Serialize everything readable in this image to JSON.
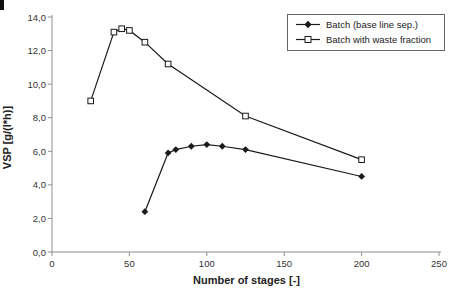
{
  "chart_data": {
    "type": "line",
    "title": "",
    "xlabel": "Number of stages [-]",
    "ylabel": "VSP [g/(l*h)]",
    "xlim": [
      0,
      250
    ],
    "ylim": [
      0,
      14
    ],
    "grid": false,
    "legend_position": "top-right",
    "x_ticks": [
      0,
      50,
      100,
      150,
      200,
      250
    ],
    "x_tick_labels": [
      "0",
      "50",
      "100",
      "150",
      "200",
      "250"
    ],
    "y_ticks": [
      0,
      2,
      4,
      6,
      8,
      10,
      12,
      14
    ],
    "y_tick_labels": [
      "0,0",
      "2,0",
      "4,0",
      "6,0",
      "8,0",
      "10,0",
      "12,0",
      "14,0"
    ],
    "series": [
      {
        "name": "Batch (base line sep.)",
        "marker": "filled-diamond",
        "color": "#1a1a1a",
        "x": [
          60,
          75,
          80,
          90,
          100,
          110,
          125,
          200
        ],
        "y": [
          2.4,
          5.9,
          6.1,
          6.3,
          6.4,
          6.3,
          6.1,
          4.5
        ]
      },
      {
        "name": "Batch with waste fraction",
        "marker": "open-square",
        "color": "#1a1a1a",
        "x": [
          25,
          40,
          45,
          50,
          60,
          75,
          125,
          200
        ],
        "y": [
          9.0,
          13.1,
          13.3,
          13.2,
          12.5,
          11.2,
          8.1,
          5.5
        ]
      }
    ],
    "colors": {
      "line": "#1a1a1a",
      "axis": "#909090",
      "tick_text": "#333333",
      "background": "#ffffff"
    }
  }
}
